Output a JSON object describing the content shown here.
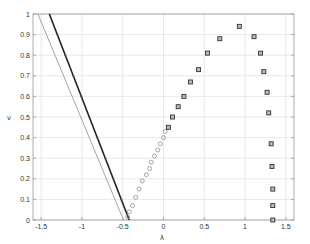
{
  "chart_data": {
    "type": "scatter",
    "title": "",
    "xlabel": "λ",
    "ylabel": "ν",
    "xlim": [
      -1.6,
      1.6
    ],
    "ylim": [
      0,
      1
    ],
    "grid": true,
    "legend": null,
    "xticks": [
      -1.5,
      -1,
      -0.5,
      0,
      0.5,
      1,
      1.5
    ],
    "xtick_labels": [
      "-1.5",
      "-1",
      "-0.5",
      "0",
      "0.5",
      "1",
      "1.5"
    ],
    "yticks": [
      0,
      0.1,
      0.2,
      0.3,
      0.4,
      0.5,
      0.6,
      0.7,
      0.8,
      0.9,
      1
    ],
    "ytick_labels": [
      "0",
      "0.1",
      "0.2",
      "0.3",
      "0.4",
      "0.5",
      "0.6",
      "0.7",
      "0.8",
      "0.9",
      "1"
    ],
    "series": [
      {
        "name": "dark-line",
        "kind": "line",
        "color": "#222222",
        "width": 1.6,
        "x": [
          -1.4,
          -0.42
        ],
        "y": [
          1.0,
          0.0
        ]
      },
      {
        "name": "light-line",
        "kind": "line",
        "color": "#9a9a9a",
        "width": 0.9,
        "x": [
          -1.54,
          -0.49
        ],
        "y": [
          1.0,
          0.0
        ]
      },
      {
        "name": "circles",
        "kind": "marker-circle",
        "color": "#9a9a9a",
        "x": [
          -0.44,
          -0.42,
          -0.38,
          -0.34,
          -0.3,
          -0.26,
          -0.21,
          -0.17,
          -0.15,
          -0.11,
          -0.07,
          -0.04,
          0.0,
          0.02
        ],
        "y": [
          0.015,
          0.04,
          0.07,
          0.11,
          0.15,
          0.19,
          0.22,
          0.25,
          0.28,
          0.31,
          0.34,
          0.37,
          0.4,
          0.43
        ]
      },
      {
        "name": "squares",
        "kind": "marker-square",
        "color": "#333333",
        "x": [
          0.06,
          0.11,
          0.18,
          0.25,
          0.33,
          0.43,
          0.54,
          0.69,
          0.93,
          1.11,
          1.19,
          1.23,
          1.27,
          1.29,
          1.32,
          1.33,
          1.34,
          1.34,
          1.34
        ],
        "y": [
          0.45,
          0.5,
          0.55,
          0.6,
          0.67,
          0.73,
          0.81,
          0.88,
          0.94,
          0.89,
          0.81,
          0.72,
          0.62,
          0.52,
          0.37,
          0.26,
          0.15,
          0.07,
          0.0
        ]
      }
    ]
  }
}
